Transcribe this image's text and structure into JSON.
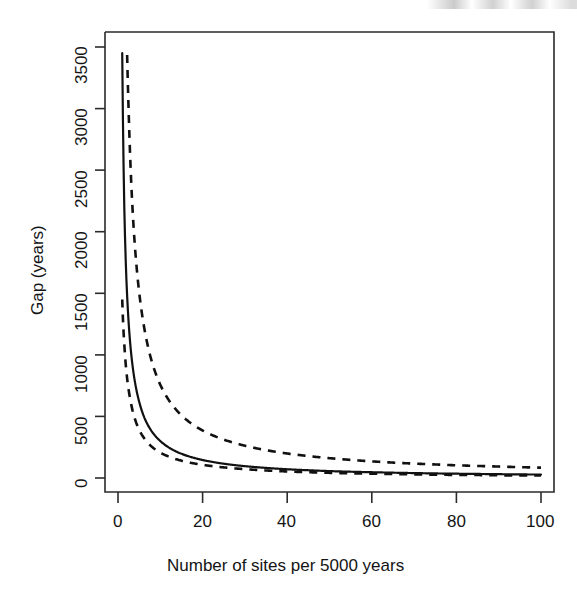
{
  "figure": {
    "background_color": "#ffffff",
    "line_color": "#111111",
    "axis_color": "#2b2b2b"
  },
  "chart_data": {
    "type": "line",
    "title": "",
    "subtitle": "",
    "xlabel": "Number of sites per 5000 years",
    "ylabel": "Gap (years)",
    "xlim": [
      0,
      104
    ],
    "ylim": [
      -120,
      3680
    ],
    "xticks": [
      0,
      20,
      40,
      60,
      80,
      100
    ],
    "xticklabels": [
      "0",
      "20",
      "40",
      "60",
      "80",
      "100"
    ],
    "yticks": [
      0,
      500,
      1000,
      1500,
      2000,
      2500,
      3000,
      3500
    ],
    "yticklabels": [
      "0",
      "500",
      "1000",
      "1500",
      "2000",
      "2500",
      "3000",
      "3500"
    ],
    "grid": false,
    "legend": null,
    "x": [
      1,
      1.5,
      2,
      2.5,
      3,
      4,
      5,
      6,
      7,
      8,
      9,
      10,
      12,
      14,
      16,
      18,
      20,
      25,
      30,
      35,
      40,
      45,
      50,
      55,
      60,
      65,
      70,
      75,
      80,
      85,
      90,
      95,
      100
    ],
    "series": [
      {
        "name": "Expected gap",
        "style": "solid",
        "values": [
          3450,
          2180,
          1600,
          1270,
          1050,
          780,
          620,
          510,
          434,
          378,
          334,
          300,
          248,
          211,
          184,
          163,
          146,
          116,
          96,
          82,
          71,
          63,
          56,
          51,
          47,
          43,
          40,
          37,
          35,
          33,
          31,
          29,
          28
        ]
      },
      {
        "name": "Upper confidence bound",
        "style": "dashed",
        "values": [
          3680,
          3680,
          3680,
          3000,
          2500,
          1880,
          1510,
          1260,
          1080,
          945,
          840,
          757,
          633,
          545,
          478,
          427,
          386,
          312,
          262,
          226,
          199,
          178,
          161,
          147,
          135,
          125,
          117,
          110,
          103,
          98,
          93,
          88,
          84
        ]
      },
      {
        "name": "Lower confidence bound",
        "style": "dashed",
        "values": [
          1450,
          1080,
          860,
          720,
          620,
          480,
          392,
          332,
          288,
          254,
          228,
          206,
          174,
          150,
          132,
          118,
          107,
          86,
          72,
          61,
          53,
          47,
          42,
          38,
          35,
          32,
          29,
          27,
          25,
          24,
          22,
          21,
          20
        ]
      }
    ],
    "annotations": []
  }
}
